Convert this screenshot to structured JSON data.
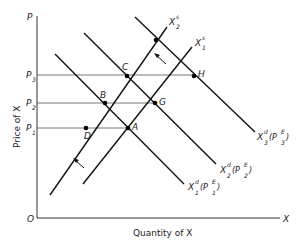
{
  "diagram": {
    "axes": {
      "y_label": "Price of X",
      "x_label": "Quantity of X",
      "y_axis_symbol": "P",
      "x_axis_symbol": "X",
      "origin": "O"
    },
    "price_levels": [
      {
        "name": "P",
        "sub": "3"
      },
      {
        "name": "P",
        "sub": "2"
      },
      {
        "name": "P",
        "sub": "1"
      }
    ],
    "points": {
      "A": "A",
      "B": "B",
      "C": "C",
      "D": "D",
      "G": "G",
      "H": "H"
    },
    "supply_curves": [
      {
        "base": "X",
        "sup": "s",
        "sub": "2"
      },
      {
        "base": "X",
        "sup": "s",
        "sub": "1"
      }
    ],
    "demand_curves": [
      {
        "base": "X",
        "sup": "d",
        "sub": "3",
        "arg": "(P",
        "arg_sup": "E",
        "arg_sub": "3",
        "close": ")"
      },
      {
        "base": "X",
        "sup": "d",
        "sub": "2",
        "arg": "(P",
        "arg_sup": "E",
        "arg_sub": "2",
        "close": ")"
      },
      {
        "base": "X",
        "sup": "d",
        "sub": "1",
        "arg": "(P",
        "arg_sup": "E",
        "arg_sub": "1",
        "close": ")"
      }
    ]
  }
}
